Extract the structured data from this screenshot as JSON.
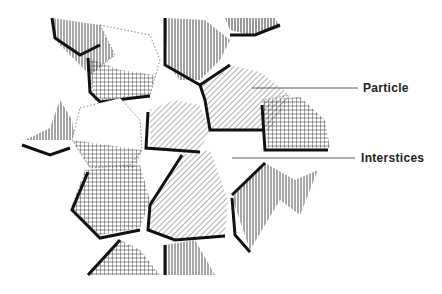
{
  "diagram": {
    "type": "illustration",
    "labels": [
      {
        "id": "particle",
        "text": "Particle"
      },
      {
        "id": "interstices",
        "text": "Interstices"
      }
    ],
    "colors": {
      "ink": "#1a1a1a",
      "background": "#ffffff"
    }
  }
}
